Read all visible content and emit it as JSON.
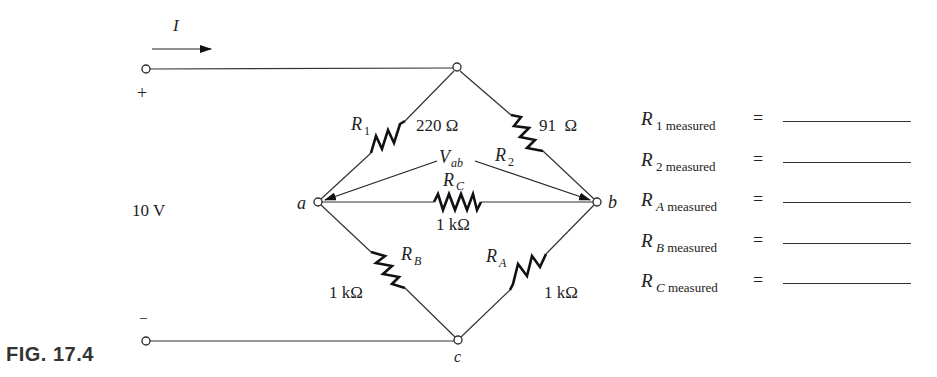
{
  "figure": {
    "label": "FIG. 17.4"
  },
  "source": {
    "voltage": "10 V",
    "plus": "+",
    "minus": "–",
    "current_label": "I"
  },
  "nodes": {
    "a": "a",
    "b": "b",
    "c": "c"
  },
  "resistors": [
    {
      "name": "R",
      "sub": "1",
      "value": "220 Ω"
    },
    {
      "name": "R",
      "sub": "2",
      "value": "91  Ω"
    },
    {
      "name": "R",
      "sub": "C",
      "value": "1 kΩ"
    },
    {
      "name": "R",
      "sub": "B",
      "value": "1 kΩ"
    },
    {
      "name": "R",
      "sub": "A",
      "value": "1 kΩ"
    }
  ],
  "voltage_label": {
    "name": "V",
    "sub": "ab"
  },
  "measurements": [
    {
      "name": "R",
      "sub": "1",
      "suffix": "measured",
      "equals": "=",
      "value": ""
    },
    {
      "name": "R",
      "sub": "2",
      "suffix": "measured",
      "equals": "=",
      "value": ""
    },
    {
      "name": "R",
      "sub": "A",
      "suffix": "measured",
      "equals": "=",
      "value": ""
    },
    {
      "name": "R",
      "sub": "B",
      "suffix": "measured",
      "equals": "=",
      "value": ""
    },
    {
      "name": "R",
      "sub": "C",
      "suffix": "measured",
      "equals": "=",
      "value": ""
    }
  ]
}
